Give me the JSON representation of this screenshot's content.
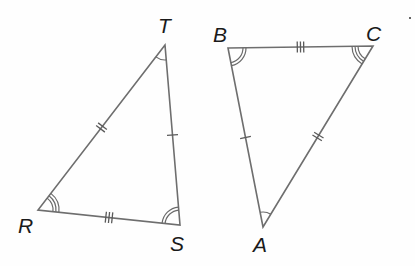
{
  "figure": {
    "colors": {
      "line": "#6e6e6e",
      "label": "#1a1a1a",
      "background": "#fefefe"
    }
  },
  "triangles": [
    {
      "name": "RST",
      "vertices": [
        {
          "label": "T",
          "x": 165,
          "y": 45,
          "lx": 158,
          "ly": 33,
          "arcs": 1
        },
        {
          "label": "R",
          "x": 38,
          "y": 210,
          "lx": 18,
          "ly": 233,
          "arcs": 3
        },
        {
          "label": "S",
          "x": 180,
          "y": 225,
          "lx": 170,
          "ly": 251,
          "arcs": 2
        }
      ],
      "sides": [
        {
          "from": "R",
          "to": "T",
          "ticks": 2
        },
        {
          "from": "T",
          "to": "S",
          "ticks": 1
        },
        {
          "from": "R",
          "to": "S",
          "ticks": 3
        }
      ]
    },
    {
      "name": "ABC",
      "vertices": [
        {
          "label": "B",
          "x": 228,
          "y": 48,
          "lx": 213,
          "ly": 42,
          "arcs": 2
        },
        {
          "label": "C",
          "x": 373,
          "y": 46,
          "lx": 366,
          "ly": 41,
          "arcs": 3
        },
        {
          "label": "A",
          "x": 263,
          "y": 227,
          "lx": 253,
          "ly": 252,
          "arcs": 1
        }
      ],
      "sides": [
        {
          "from": "B",
          "to": "C",
          "ticks": 3
        },
        {
          "from": "B",
          "to": "A",
          "ticks": 1
        },
        {
          "from": "A",
          "to": "C",
          "ticks": 2
        }
      ]
    }
  ],
  "labels": {
    "T": "T",
    "R": "R",
    "S": "S",
    "B": "B",
    "C": "C",
    "A": "A"
  },
  "stray_mark": {
    "x": 410,
    "y": 18
  }
}
